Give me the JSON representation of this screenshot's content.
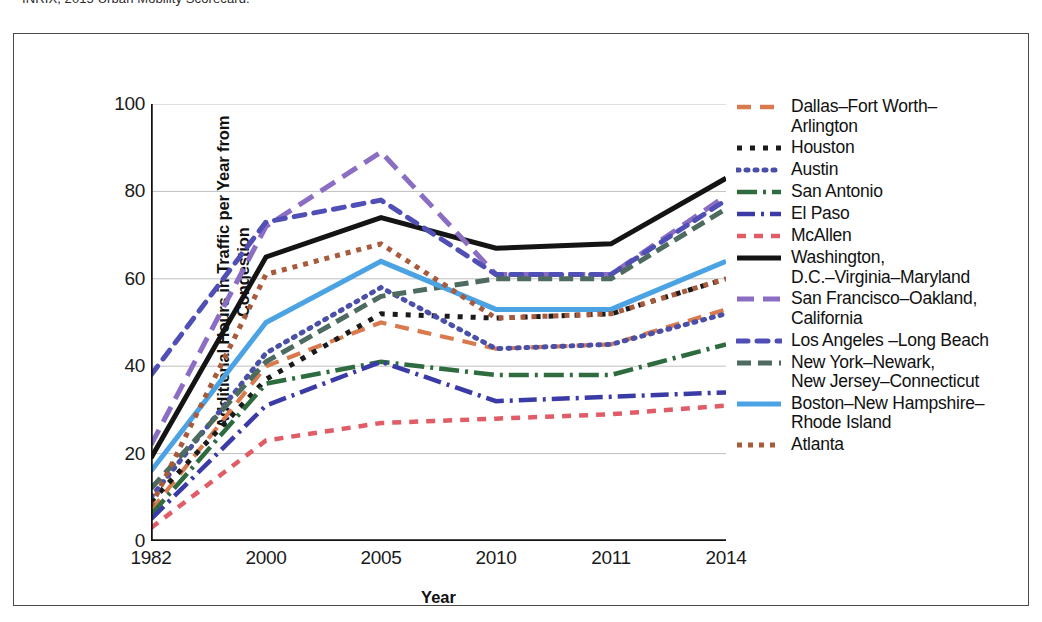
{
  "source_caption": "INRIX, 2015 Urban Mobility Scorecard.",
  "axes": {
    "y_title": "Additional Hours in Traffic per Year\nfrom Congestion",
    "x_title": "Year"
  },
  "chart_data": {
    "type": "line",
    "title": "",
    "xlabel": "Year",
    "ylabel": "Additional Hours in Traffic per Year from Congestion",
    "categories": [
      "1982",
      "2000",
      "2005",
      "2010",
      "2011",
      "2014"
    ],
    "x": [
      1982,
      2000,
      2005,
      2010,
      2011,
      2014
    ],
    "ylim": [
      0,
      100
    ],
    "yticks": [
      0,
      20,
      40,
      60,
      80,
      100
    ],
    "grid": true,
    "legend_position": "right",
    "series": [
      {
        "name": "Dallas–Fort Worth–\nArlington",
        "color": "#D97A4E",
        "dash": "14,9",
        "width": 4.2,
        "cap": "butt",
        "values": [
          7,
          40,
          50,
          44,
          45,
          53
        ]
      },
      {
        "name": "Houston",
        "color": "#1B1B1B",
        "dash": "5,8",
        "width": 5,
        "cap": "butt",
        "values": [
          9,
          37,
          52,
          51,
          52,
          60
        ]
      },
      {
        "name": "Austin",
        "color": "#4A4FA8",
        "dash": "2,7",
        "width": 5,
        "cap": "round",
        "values": [
          10,
          43,
          58,
          44,
          45,
          52
        ]
      },
      {
        "name": "San Antonio",
        "color": "#2E6B3E",
        "dash": "20,6,3,6",
        "width": 4.5,
        "cap": "butt",
        "values": [
          6,
          36,
          41,
          38,
          38,
          45
        ]
      },
      {
        "name": "El Paso",
        "color": "#3B3BA8",
        "dash": "18,6,3,6",
        "width": 4.5,
        "cap": "butt",
        "values": [
          5,
          31,
          41,
          32,
          33,
          34
        ]
      },
      {
        "name": "McAllen",
        "color": "#E05C66",
        "dash": "9,8",
        "width": 4.5,
        "cap": "butt",
        "values": [
          3,
          23,
          27,
          28,
          29,
          31
        ]
      },
      {
        "name": "Washington,\nD.C.–Virginia–Maryland",
        "color": "#141414",
        "dash": "",
        "width": 5,
        "cap": "butt",
        "values": [
          19,
          65,
          74,
          67,
          68,
          83
        ]
      },
      {
        "name": "San Francisco–Oakland,\nCalifornia",
        "color": "#8B6EC4",
        "dash": "17,9",
        "width": 5,
        "cap": "butt",
        "values": [
          22,
          72,
          89,
          61,
          61,
          79
        ]
      },
      {
        "name": "Los Angeles –Long Beach",
        "color": "#4F4FB5",
        "dash": "11,9",
        "width": 5,
        "cap": "round",
        "values": [
          38,
          73,
          78,
          61,
          61,
          78
        ]
      },
      {
        "name": "New York–Newark,\nNew Jersey–Connecticut",
        "color": "#4D6B5E",
        "dash": "14,7",
        "width": 5,
        "cap": "butt",
        "values": [
          12,
          41,
          56,
          60,
          60,
          76
        ]
      },
      {
        "name": "Boston–New Hampshire–\nRhode Island",
        "color": "#4BA3E3",
        "dash": "",
        "width": 5,
        "cap": "butt",
        "values": [
          16,
          50,
          64,
          53,
          53,
          64
        ]
      },
      {
        "name": "Atlanta",
        "color": "#A85A3C",
        "dash": "5,6",
        "width": 5,
        "cap": "butt",
        "values": [
          8,
          61,
          68,
          51,
          52,
          60
        ]
      }
    ]
  }
}
